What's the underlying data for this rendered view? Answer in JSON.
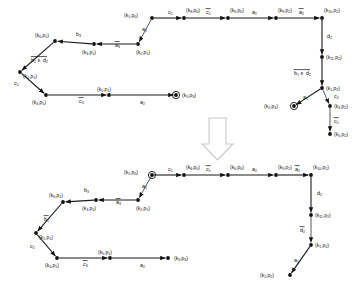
{
  "figure": {
    "background_color": "#ffffff",
    "ink_color": "#111111",
    "arrow_glyph_color": "#c9c9c9"
  },
  "transform_arrow": {
    "name": "down-arrow",
    "direction": "down"
  },
  "diagrams": [
    {
      "id": "top",
      "name": "top-automaton",
      "nodes": [
        {
          "id": "t_k1p0",
          "label": "(k₁,p₀)",
          "x": 152,
          "y": 18,
          "accept": false,
          "label_dx": -28,
          "label_dy": -1
        },
        {
          "id": "t_k8p0",
          "label": "(k₈,p₀)",
          "x": 184,
          "y": 18,
          "accept": false,
          "label_dx": 2,
          "label_dy": -6
        },
        {
          "id": "t_k6p0",
          "label": "(k₆,p₀)",
          "x": 228,
          "y": 18,
          "accept": false,
          "label_dx": 2,
          "label_dy": -6
        },
        {
          "id": "t_k9p2",
          "label": "(k₉,p₂)",
          "x": 276,
          "y": 18,
          "accept": false,
          "label_dx": 2,
          "label_dy": -6
        },
        {
          "id": "t_k10p2",
          "label": "(k₁₀,p₂)",
          "x": 322,
          "y": 18,
          "accept": false,
          "label_dx": 2,
          "label_dy": -6
        },
        {
          "id": "t_k11p2",
          "label": "(k₁₁,p₂)",
          "x": 322,
          "y": 57,
          "accept": false,
          "label_dx": 4,
          "label_dy": 2
        },
        {
          "id": "t_k1p2",
          "label": "(k₁,p₂)",
          "x": 322,
          "y": 88,
          "accept": false,
          "label_dx": 4,
          "label_dy": 2
        },
        {
          "id": "t_k4p2",
          "label": "(k₄,p₂)",
          "x": 330,
          "y": 106,
          "accept": false,
          "label_dx": 4,
          "label_dy": 2
        },
        {
          "id": "t_k5p2",
          "label": "(k₅,p₂)",
          "x": 330,
          "y": 134,
          "accept": false,
          "label_dx": 4,
          "label_dy": 2
        },
        {
          "id": "t_k2p3",
          "label": "(k₂,p₃)",
          "x": 294,
          "y": 106,
          "accept": true,
          "label_dx": -30,
          "label_dy": 2
        },
        {
          "id": "t_k2p1",
          "label": "(k₂,p₁)",
          "x": 138,
          "y": 44,
          "accept": false,
          "label_dx": -2,
          "label_dy": 10
        },
        {
          "id": "t_k3p1",
          "label": "(k₃,p₁)",
          "x": 94,
          "y": 44,
          "accept": false,
          "label_dx": -12,
          "label_dy": 10
        },
        {
          "id": "t_k6p1",
          "label": "(k₆,p₁)",
          "x": 55,
          "y": 41,
          "accept": false,
          "label_dx": -20,
          "label_dy": -4
        },
        {
          "id": "t_k1p1",
          "label": "(k₁,p₁)",
          "x": 20,
          "y": 72,
          "accept": false,
          "label_dx": 3,
          "label_dy": 6
        },
        {
          "id": "t_k4p1",
          "label": "(k₄,p₁)",
          "x": 46,
          "y": 95,
          "accept": false,
          "label_dx": -14,
          "label_dy": 9
        },
        {
          "id": "t_k5p1",
          "label": "(k₅,p₁)",
          "x": 109,
          "y": 95,
          "accept": false,
          "label_dx": -12,
          "label_dy": -4
        },
        {
          "id": "t_k3p3",
          "label": "(k₃,p₃)",
          "x": 176,
          "y": 95,
          "accept": true,
          "label_dx": 6,
          "label_dy": 2
        }
      ],
      "edges": [
        {
          "from": "t_k1p0",
          "to": "t_k8p0",
          "label": "c₁",
          "overline": false,
          "lx": 168,
          "ly": 14
        },
        {
          "from": "t_k8p0",
          "to": "t_k6p0",
          "label": "c₁",
          "overline": true,
          "lx": 206,
          "ly": 14
        },
        {
          "from": "t_k6p0",
          "to": "t_k9p2",
          "label": "a₂",
          "overline": false,
          "lx": 252,
          "ly": 14
        },
        {
          "from": "t_k9p2",
          "to": "t_k10p2",
          "label": "a₂",
          "overline": true,
          "lx": 299,
          "ly": 14
        },
        {
          "from": "t_k10p2",
          "to": "t_k11p2",
          "label": "d₂",
          "overline": false,
          "lx": 327,
          "ly": 38
        },
        {
          "from": "t_k11p2",
          "to": "t_k1p2",
          "label": "b₁ ∧ d₂",
          "overline": true,
          "lx": 294,
          "ly": 75
        },
        {
          "from": "t_k1p2",
          "to": "t_k4p2",
          "label": "c₂",
          "overline": false,
          "lx": 334,
          "ly": 98
        },
        {
          "from": "t_k4p2",
          "to": "t_k5p2",
          "label": "c₂",
          "overline": true,
          "lx": 334,
          "ly": 123
        },
        {
          "from": "t_k1p2",
          "to": "t_k2p3",
          "label": "a₁",
          "overline": false,
          "lx": 303,
          "ly": 99
        },
        {
          "from": "t_k1p0",
          "to": "t_k2p1",
          "label": "a₁",
          "overline": false,
          "lx": 142,
          "ly": 31
        },
        {
          "from": "t_k2p1",
          "to": "t_k3p1",
          "label": "a₃",
          "overline": true,
          "lx": 115,
          "ly": 47
        },
        {
          "from": "t_k3p1",
          "to": "t_k6p1",
          "label": "b₃",
          "overline": false,
          "lx": 76,
          "ly": 36
        },
        {
          "from": "t_k6p1",
          "to": "t_k1p1",
          "label": "b₁ ∧ d₂",
          "overline": true,
          "lx": 31,
          "ly": 62
        },
        {
          "from": "t_k1p1",
          "to": "t_k4p1",
          "label": "c₂",
          "overline": false,
          "lx": 14,
          "ly": 85
        },
        {
          "from": "t_k4p1",
          "to": "t_k5p1",
          "label": "c₃",
          "overline": true,
          "lx": 79,
          "ly": 103
        },
        {
          "from": "t_k5p1",
          "to": "t_k3p3",
          "label": "a₂",
          "overline": false,
          "lx": 140,
          "ly": 104
        }
      ]
    },
    {
      "id": "bottom",
      "name": "bottom-automaton",
      "nodes": [
        {
          "id": "b_k1p0",
          "label": "(k₁,p₀)",
          "x": 152,
          "y": 175,
          "accept": true,
          "label_dx": -28,
          "label_dy": -1
        },
        {
          "id": "b_k8p0",
          "label": "(k₈,p₀)",
          "x": 184,
          "y": 175,
          "accept": false,
          "label_dx": 2,
          "label_dy": -6
        },
        {
          "id": "b_k6p0",
          "label": "(k₆,p₀)",
          "x": 228,
          "y": 175,
          "accept": false,
          "label_dx": 2,
          "label_dy": -6
        },
        {
          "id": "b_k9p2",
          "label": "(k₉,p₂)",
          "x": 276,
          "y": 175,
          "accept": false,
          "label_dx": 2,
          "label_dy": -6
        },
        {
          "id": "b_k10p2",
          "label": "(k₁₀,p₂)",
          "x": 311,
          "y": 175,
          "accept": false,
          "label_dx": 2,
          "label_dy": -6
        },
        {
          "id": "b_k11p2",
          "label": "(k₁₁,p₂)",
          "x": 311,
          "y": 215,
          "accept": false,
          "label_dx": 4,
          "label_dy": 2
        },
        {
          "id": "b_k1p2",
          "label": "(k₁,p₂)",
          "x": 311,
          "y": 245,
          "accept": false,
          "label_dx": 4,
          "label_dy": 2
        },
        {
          "id": "b_k2p2",
          "label": "(k₂,p₂)",
          "x": 290,
          "y": 275,
          "accept": false,
          "label_dx": -30,
          "label_dy": 2
        },
        {
          "id": "b_k2p1",
          "label": "(k₂,p₁)",
          "x": 138,
          "y": 200,
          "accept": false,
          "label_dx": -2,
          "label_dy": 10
        },
        {
          "id": "b_k3p1",
          "label": "(k₃,p₁)",
          "x": 96,
          "y": 200,
          "accept": false,
          "label_dx": -14,
          "label_dy": 10
        },
        {
          "id": "b_k6p1",
          "label": "(k₆,p₁)",
          "x": 63,
          "y": 202,
          "accept": false,
          "label_dx": -14,
          "label_dy": -5
        },
        {
          "id": "b_k1p1",
          "label": "(k₁,p₁)",
          "x": 36,
          "y": 233,
          "accept": false,
          "label_dx": 3,
          "label_dy": 6
        },
        {
          "id": "b_k4p1",
          "label": "(k₄,p₁)",
          "x": 57,
          "y": 258,
          "accept": false,
          "label_dx": -12,
          "label_dy": 9
        },
        {
          "id": "b_k5p1",
          "label": "(k₅,p₁)",
          "x": 110,
          "y": 258,
          "accept": false,
          "label_dx": -12,
          "label_dy": -4
        },
        {
          "id": "b_k3p3",
          "label": "(k₃,p₃)",
          "x": 168,
          "y": 258,
          "accept": false,
          "label_dx": 6,
          "label_dy": 2
        }
      ],
      "edges": [
        {
          "from": "b_k1p0",
          "to": "b_k8p0",
          "label": "c₁",
          "overline": false,
          "lx": 168,
          "ly": 171
        },
        {
          "from": "b_k8p0",
          "to": "b_k6p0",
          "label": "c₁",
          "overline": true,
          "lx": 206,
          "ly": 171
        },
        {
          "from": "b_k6p0",
          "to": "b_k9p2",
          "label": "a₂",
          "overline": false,
          "lx": 252,
          "ly": 171
        },
        {
          "from": "b_k9p2",
          "to": "b_k10p2",
          "label": "a₂",
          "overline": true,
          "lx": 295,
          "ly": 171
        },
        {
          "from": "b_k10p2",
          "to": "b_k11p2",
          "label": "d₂",
          "overline": false,
          "lx": 317,
          "ly": 195
        },
        {
          "from": "b_k11p2",
          "to": "b_k1p2",
          "label": "d₂",
          "overline": true,
          "lx": 300,
          "ly": 232
        },
        {
          "from": "b_k1p2",
          "to": "b_k2p2",
          "label": "a₁",
          "overline": false,
          "lx": 294,
          "ly": 262
        },
        {
          "from": "b_k1p0",
          "to": "b_k2p1",
          "label": "a₁",
          "overline": false,
          "lx": 142,
          "ly": 188
        },
        {
          "from": "b_k2p1",
          "to": "b_k3p1",
          "label": "a₃",
          "overline": true,
          "lx": 116,
          "ly": 204
        },
        {
          "from": "b_k3p1",
          "to": "b_k6p1",
          "label": "b₃",
          "overline": false,
          "lx": 84,
          "ly": 192
        },
        {
          "from": "b_k6p1",
          "to": "b_k1p1",
          "label": "b₁",
          "overline": true,
          "lx": 44,
          "ly": 221
        },
        {
          "from": "b_k1p1",
          "to": "b_k4p1",
          "label": "c₂",
          "overline": false,
          "lx": 30,
          "ly": 248
        },
        {
          "from": "b_k4p1",
          "to": "b_k5p1",
          "label": "c₃",
          "overline": true,
          "lx": 83,
          "ly": 266
        },
        {
          "from": "b_k5p1",
          "to": "b_k3p3",
          "label": "a₂",
          "overline": false,
          "lx": 140,
          "ly": 267
        }
      ]
    }
  ]
}
